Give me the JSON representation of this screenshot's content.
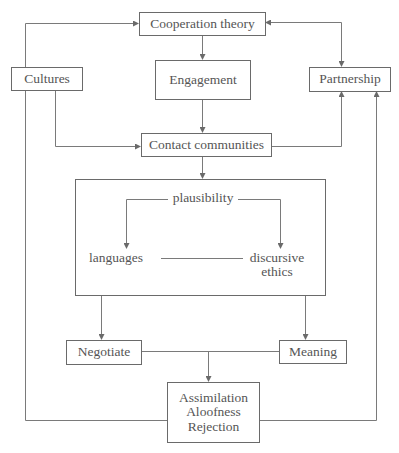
{
  "diagram": {
    "type": "flowchart",
    "nodes": {
      "cooperation_theory": "Cooperation theory",
      "engagement": "Engagement",
      "cultures": "Cultures",
      "partnership": "Partnership",
      "contact_communities": "Contact communities",
      "plausibility": "plausibility",
      "languages": "languages",
      "discursive_ethics_line1": "discursive",
      "discursive_ethics_line2": "ethics",
      "negotiate": "Negotiate",
      "meaning": "Meaning",
      "outcome_line1": "Assimilation",
      "outcome_line2": "Aloofness",
      "outcome_line3": "Rejection"
    },
    "edges": [
      {
        "from": "Cultures",
        "to": "Cooperation theory"
      },
      {
        "from": "Cooperation theory",
        "to": "Partnership",
        "bidirectional": true
      },
      {
        "from": "Cooperation theory",
        "to": "Engagement"
      },
      {
        "from": "Engagement",
        "to": "Contact communities"
      },
      {
        "from": "Cultures",
        "to": "Contact communities"
      },
      {
        "from": "Contact communities",
        "to": "Partnership"
      },
      {
        "from": "Contact communities",
        "to": "Inner box"
      },
      {
        "from": "plausibility",
        "to": "languages"
      },
      {
        "from": "plausibility",
        "to": "discursive ethics"
      },
      {
        "from": "languages",
        "to": "discursive ethics",
        "undirected": true
      },
      {
        "from": "Inner box",
        "to": "Negotiate"
      },
      {
        "from": "Inner box",
        "to": "Meaning"
      },
      {
        "from": "Negotiate + Meaning",
        "to": "Assimilation / Aloofness / Rejection"
      },
      {
        "from": "Cultures",
        "to": "Assimilation / Aloofness / Rejection",
        "undirected": true
      },
      {
        "from": "Assimilation / Aloofness / Rejection",
        "to": "Partnership"
      }
    ],
    "colors": {
      "line": "#6a6a6a",
      "text": "#555555",
      "background": "#ffffff"
    }
  }
}
